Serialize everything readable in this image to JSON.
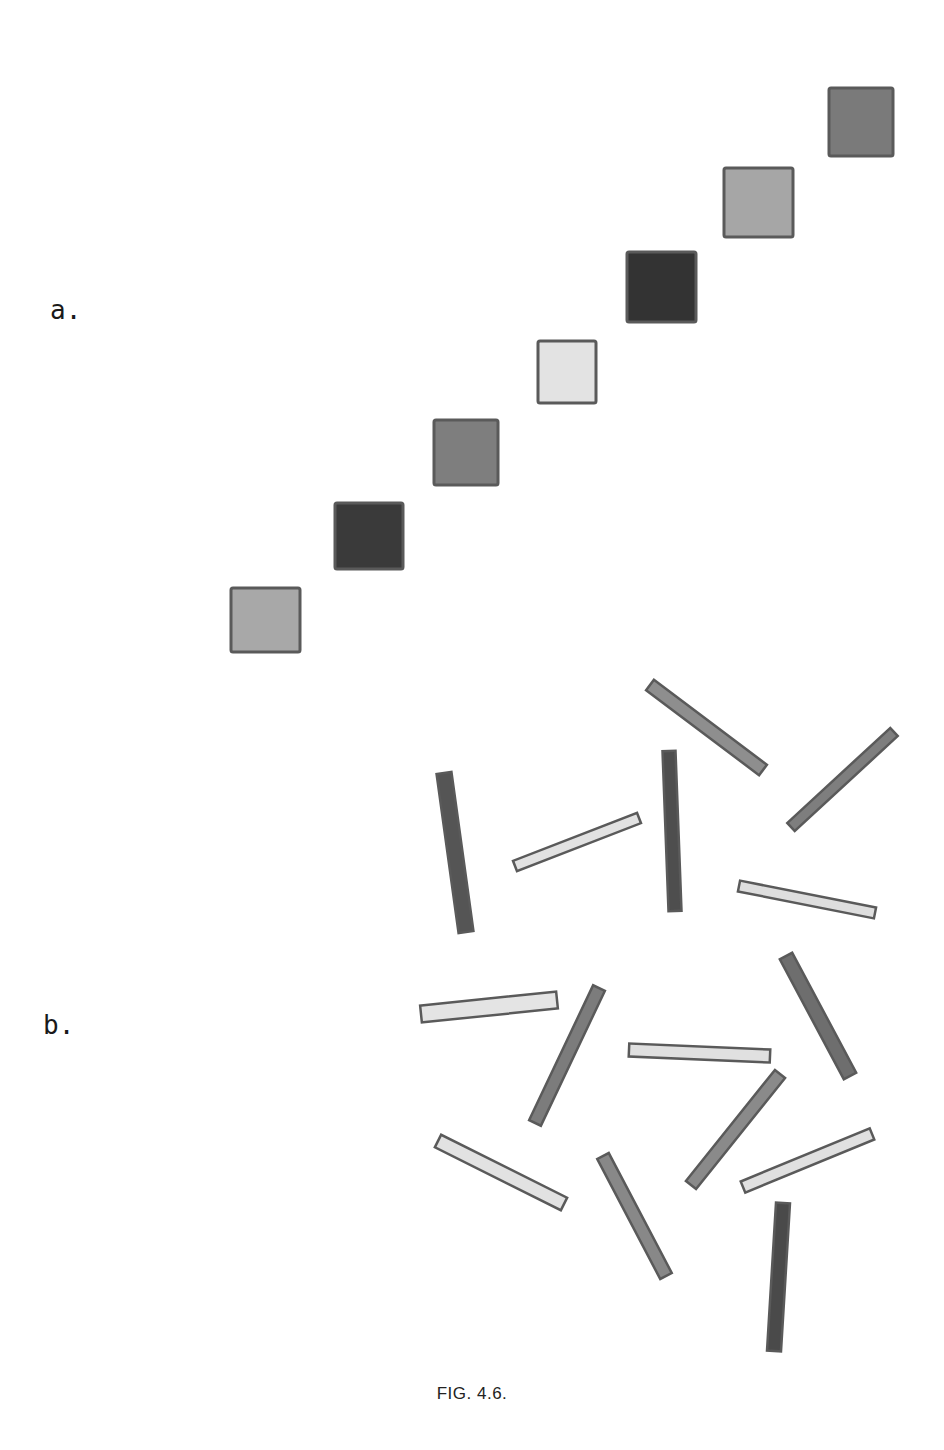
{
  "figure": {
    "caption": "FIG. 4.6.",
    "panels": [
      {
        "label": "a.",
        "description": "Diagonal row of squares with varying gray levels",
        "squares": [
          {
            "x": 231,
            "y": 588,
            "w": 69,
            "h": 64,
            "fill": "#a8a8a8"
          },
          {
            "x": 335,
            "y": 503,
            "w": 68,
            "h": 66,
            "fill": "#3a3a3a"
          },
          {
            "x": 434,
            "y": 420,
            "w": 64,
            "h": 65,
            "fill": "#7e7e7e"
          },
          {
            "x": 538,
            "y": 341,
            "w": 58,
            "h": 62,
            "fill": "#e3e3e3"
          },
          {
            "x": 627,
            "y": 252,
            "w": 69,
            "h": 70,
            "fill": "#333333"
          },
          {
            "x": 724,
            "y": 168,
            "w": 69,
            "h": 69,
            "fill": "#a6a6a6"
          },
          {
            "x": 829,
            "y": 88,
            "w": 64,
            "h": 68,
            "fill": "#7a7a7a"
          }
        ]
      },
      {
        "label": "b.",
        "description": "Randomly oriented bars of varying gray levels",
        "bars": [
          {
            "x1": 650,
            "y1": 685,
            "x2": 763,
            "y2": 770,
            "width": 13,
            "fill": "#8e8e8e"
          },
          {
            "x1": 894,
            "y1": 732,
            "x2": 791,
            "y2": 827,
            "width": 11,
            "fill": "#7e7e7e"
          },
          {
            "x1": 444,
            "y1": 773,
            "x2": 466,
            "y2": 932,
            "width": 15,
            "fill": "#555555"
          },
          {
            "x1": 515,
            "y1": 866,
            "x2": 639,
            "y2": 818,
            "width": 11,
            "fill": "#e2e2e2"
          },
          {
            "x1": 669,
            "y1": 751,
            "x2": 675,
            "y2": 911,
            "width": 13,
            "fill": "#4e4e4e"
          },
          {
            "x1": 739,
            "y1": 886,
            "x2": 875,
            "y2": 913,
            "width": 11,
            "fill": "#dedede"
          },
          {
            "x1": 421,
            "y1": 1014,
            "x2": 557,
            "y2": 1000,
            "width": 17,
            "fill": "#e4e4e4"
          },
          {
            "x1": 599,
            "y1": 988,
            "x2": 535,
            "y2": 1123,
            "width": 13,
            "fill": "#7c7c7c"
          },
          {
            "x1": 629,
            "y1": 1050,
            "x2": 770,
            "y2": 1056,
            "width": 13,
            "fill": "#e0e0e0"
          },
          {
            "x1": 786,
            "y1": 956,
            "x2": 850,
            "y2": 1076,
            "width": 14,
            "fill": "#6e6e6e"
          },
          {
            "x1": 780,
            "y1": 1074,
            "x2": 691,
            "y2": 1185,
            "width": 13,
            "fill": "#8a8a8a"
          },
          {
            "x1": 438,
            "y1": 1141,
            "x2": 564,
            "y2": 1204,
            "width": 14,
            "fill": "#e2e2e2"
          },
          {
            "x1": 603,
            "y1": 1156,
            "x2": 666,
            "y2": 1276,
            "width": 13,
            "fill": "#888888"
          },
          {
            "x1": 743,
            "y1": 1187,
            "x2": 872,
            "y2": 1134,
            "width": 12,
            "fill": "#e0e0e0"
          },
          {
            "x1": 783,
            "y1": 1203,
            "x2": 774,
            "y2": 1351,
            "width": 14,
            "fill": "#4a4a4a"
          }
        ]
      }
    ],
    "stroke_color": "#5a5a5a"
  }
}
